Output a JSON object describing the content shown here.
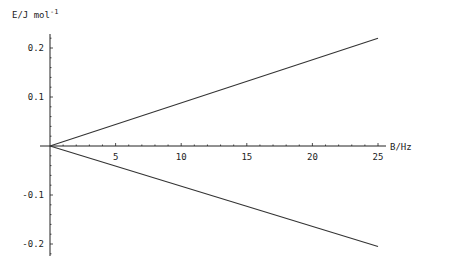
{
  "chart_data": {
    "type": "line",
    "title": "",
    "xlabel": "B/Hz",
    "ylabel": "E/J mol",
    "ylabel_superscript": "-1",
    "xlim": [
      0,
      25
    ],
    "ylim": [
      -0.22,
      0.22
    ],
    "grid": false,
    "legend": null,
    "x_ticks": [
      5,
      10,
      15,
      20,
      25
    ],
    "x_tick_labels": [
      "5",
      "10",
      "15",
      "20",
      "25"
    ],
    "y_ticks": [
      0.2,
      0.1,
      -0.1,
      -0.2
    ],
    "y_tick_labels": [
      "0.2",
      "0.1",
      "-0.1",
      "-0.2"
    ],
    "series": [
      {
        "name": "upper",
        "x": [
          0,
          25
        ],
        "values": [
          0,
          0.22
        ]
      },
      {
        "name": "lower",
        "x": [
          0,
          25
        ],
        "values": [
          0,
          -0.205
        ]
      }
    ],
    "line_color": "#333333",
    "axis_color": "#222222"
  }
}
